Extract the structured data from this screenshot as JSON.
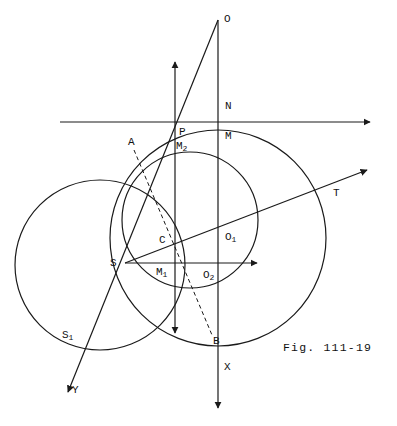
{
  "figure": {
    "caption": "Fig. 111-19",
    "caption_pos": {
      "x": 283,
      "y": 341
    },
    "width": 397,
    "height": 426,
    "stroke_color": "#1a1a1a",
    "background": "#ffffff"
  },
  "circles": [
    {
      "name": "left-circle",
      "cx": 100,
      "cy": 265,
      "r": 85
    },
    {
      "name": "right-circle",
      "cx": 218,
      "cy": 238,
      "r": 108
    },
    {
      "name": "middle-circle",
      "cx": 190,
      "cy": 220,
      "r": 68
    }
  ],
  "lines": [
    {
      "name": "horizontal-axis-top",
      "x1": 60,
      "y1": 122,
      "x2": 370,
      "y2": 122,
      "arrow": "end",
      "dashed": false
    },
    {
      "name": "vertical-axis-m2",
      "x1": 175,
      "y1": 62,
      "x2": 175,
      "y2": 333,
      "arrow": "both",
      "dashed": false
    },
    {
      "name": "vertical-axis-x",
      "x1": 218,
      "y1": 20,
      "x2": 218,
      "y2": 408,
      "arrow": "end",
      "dashed": false
    },
    {
      "name": "ray-s-horizontal",
      "x1": 125,
      "y1": 263,
      "x2": 257,
      "y2": 263,
      "arrow": "end",
      "dashed": false
    },
    {
      "name": "ray-s-t",
      "x1": 125,
      "y1": 263,
      "x2": 367,
      "y2": 170,
      "arrow": "end",
      "dashed": false
    },
    {
      "name": "line-y-p-o",
      "x1": 68,
      "y1": 392,
      "x2": 218,
      "y2": 20,
      "arrow": "start",
      "dashed": false
    },
    {
      "name": "chord-a-b",
      "x1": 134,
      "y1": 150,
      "x2": 212,
      "y2": 335,
      "arrow": "none",
      "dashed": true
    }
  ],
  "points": [
    {
      "name": "point-O",
      "label": "O",
      "sub": "",
      "x": 224,
      "y": 14
    },
    {
      "name": "point-N",
      "label": "N",
      "sub": "",
      "x": 225,
      "y": 101
    },
    {
      "name": "point-M",
      "label": "M",
      "sub": "",
      "x": 225,
      "y": 131
    },
    {
      "name": "point-P",
      "label": "P",
      "sub": "",
      "x": 179,
      "y": 127
    },
    {
      "name": "point-M2",
      "label": "M",
      "sub": "2",
      "x": 176,
      "y": 141
    },
    {
      "name": "point-A",
      "label": "A",
      "sub": "",
      "x": 128,
      "y": 137
    },
    {
      "name": "point-T",
      "label": "T",
      "sub": "",
      "x": 333,
      "y": 188
    },
    {
      "name": "point-C",
      "label": "C",
      "sub": "",
      "x": 159,
      "y": 235
    },
    {
      "name": "point-O1",
      "label": "O",
      "sub": "1",
      "x": 225,
      "y": 232
    },
    {
      "name": "point-S",
      "label": "S",
      "sub": "",
      "x": 110,
      "y": 258
    },
    {
      "name": "point-M1",
      "label": "M",
      "sub": "1",
      "x": 156,
      "y": 267
    },
    {
      "name": "point-O2",
      "label": "O",
      "sub": "2",
      "x": 203,
      "y": 270
    },
    {
      "name": "point-B",
      "label": "B",
      "sub": "",
      "x": 213,
      "y": 336
    },
    {
      "name": "point-S1",
      "label": "S",
      "sub": "1",
      "x": 62,
      "y": 330
    },
    {
      "name": "point-Y",
      "label": "Y",
      "sub": "",
      "x": 72,
      "y": 385
    },
    {
      "name": "point-X",
      "label": "X",
      "sub": "",
      "x": 224,
      "y": 362
    }
  ]
}
